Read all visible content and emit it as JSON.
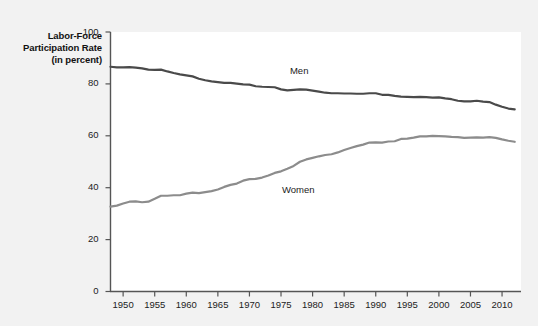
{
  "chart_data": {
    "type": "line",
    "title": "",
    "ylabel": "Labor-Force Participation Rate (in percent)",
    "xlabel": "",
    "ylim": [
      0,
      100
    ],
    "xlim": [
      1948,
      2013
    ],
    "yticks": [
      0,
      20,
      40,
      60,
      80,
      100
    ],
    "ytick_labels": [
      "0",
      "20",
      "40",
      "60",
      "80",
      "100"
    ],
    "xticks": [
      1950,
      1955,
      1960,
      1965,
      1970,
      1975,
      1980,
      1985,
      1990,
      1995,
      2000,
      2005,
      2010
    ],
    "xtick_labels": [
      "1950",
      "1955",
      "1960",
      "1965",
      "1970",
      "1975",
      "1980",
      "1985",
      "1990",
      "1995",
      "2000",
      "2005",
      "2010"
    ],
    "grid": false,
    "legend_position": "inline-annotation",
    "colors": {
      "men": "#4a4a4a",
      "women": "#8c8c8c",
      "axis": "#555555",
      "plot_background": "#ffffff",
      "figure_background": "#f2f2f2",
      "text": "#222222"
    },
    "annotations": [
      {
        "name": "men-label",
        "text": "Men",
        "x": 1978,
        "y": 85
      },
      {
        "name": "women-label",
        "text": "Women",
        "x": 1978,
        "y": 39
      }
    ],
    "x": [
      1948,
      1949,
      1950,
      1951,
      1952,
      1953,
      1954,
      1955,
      1956,
      1957,
      1958,
      1959,
      1960,
      1961,
      1962,
      1963,
      1964,
      1965,
      1966,
      1967,
      1968,
      1969,
      1970,
      1971,
      1972,
      1973,
      1974,
      1975,
      1976,
      1977,
      1978,
      1979,
      1980,
      1981,
      1982,
      1983,
      1984,
      1985,
      1986,
      1987,
      1988,
      1989,
      1990,
      1991,
      1992,
      1993,
      1994,
      1995,
      1996,
      1997,
      1998,
      1999,
      2000,
      2001,
      2002,
      2003,
      2004,
      2005,
      2006,
      2007,
      2008,
      2009,
      2010,
      2011,
      2012
    ],
    "series": [
      {
        "name": "Men",
        "color": "#4a4a4a",
        "values": [
          86.6,
          86.4,
          86.4,
          86.5,
          86.3,
          86.0,
          85.5,
          85.4,
          85.5,
          84.8,
          84.2,
          83.7,
          83.3,
          82.9,
          82.0,
          81.4,
          81.0,
          80.7,
          80.4,
          80.4,
          80.1,
          79.8,
          79.7,
          79.1,
          78.9,
          78.8,
          78.7,
          77.9,
          77.5,
          77.7,
          77.9,
          77.8,
          77.4,
          77.0,
          76.6,
          76.4,
          76.4,
          76.3,
          76.3,
          76.2,
          76.2,
          76.4,
          76.4,
          75.8,
          75.8,
          75.4,
          75.1,
          75.0,
          74.9,
          75.0,
          74.9,
          74.7,
          74.8,
          74.4,
          74.1,
          73.5,
          73.3,
          73.3,
          73.5,
          73.2,
          73.0,
          72.0,
          71.2,
          70.5,
          70.2
        ]
      },
      {
        "name": "Women",
        "color": "#8c8c8c",
        "values": [
          32.7,
          33.1,
          33.9,
          34.6,
          34.7,
          34.4,
          34.6,
          35.7,
          36.9,
          36.9,
          37.1,
          37.1,
          37.7,
          38.1,
          37.9,
          38.3,
          38.7,
          39.3,
          40.3,
          41.1,
          41.6,
          42.7,
          43.3,
          43.4,
          43.9,
          44.7,
          45.7,
          46.3,
          47.3,
          48.4,
          50.0,
          50.9,
          51.5,
          52.1,
          52.6,
          52.9,
          53.6,
          54.5,
          55.3,
          56.0,
          56.6,
          57.4,
          57.5,
          57.4,
          57.8,
          57.9,
          58.8,
          58.9,
          59.3,
          59.8,
          59.8,
          60.0,
          59.9,
          59.8,
          59.6,
          59.5,
          59.2,
          59.3,
          59.4,
          59.3,
          59.5,
          59.2,
          58.6,
          58.1,
          57.7
        ]
      }
    ]
  },
  "axis": {
    "y_title": "Labor-Force Participation Rate (in percent)"
  }
}
